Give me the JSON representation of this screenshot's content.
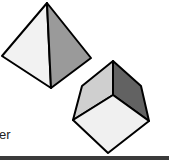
{
  "caption": {
    "text": "er"
  },
  "shapes": [
    {
      "name": "pyramid",
      "faces": [
        "light",
        "dark"
      ]
    },
    {
      "name": "cube",
      "faces": [
        "top-left",
        "top-right",
        "front"
      ]
    }
  ],
  "colors": {
    "outline": "#000000",
    "light_face": "#f2f2f2",
    "mid_face": "#c8c8c8",
    "dark_face": "#8a8a8a",
    "darker_face": "#5e5e5e",
    "bar": "#3a3a3a"
  }
}
